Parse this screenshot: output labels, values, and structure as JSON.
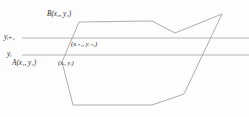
{
  "figure": {
    "background_color": "#fdfdfd",
    "stroke_color": "#8a8a8a",
    "text_color": "#2b2b2b",
    "labels": {
      "vertex_b": "B(x₂, y₂)",
      "vertex_a": "A(x₁, y₁)",
      "scanline_upper": "yᵢ₊₁",
      "scanline_lower": "yᵢ",
      "intersection_upper": "(xᵢ₊₁, yᵢ₊₁)",
      "intersection_lower": "(xᵢ, yᵢ)"
    }
  },
  "chart_data": {
    "type": "line",
    "xlabel": "",
    "ylabel": "",
    "xlim": [
      0,
      249
    ],
    "ylim": [
      117,
      0
    ],
    "grid": false,
    "legend": null,
    "series": [
      {
        "name": "polygon-outline",
        "closed": true,
        "stroke": "#8a8a8a",
        "points": [
          [
            62,
            62
          ],
          [
            79,
            22
          ],
          [
            152,
            21
          ],
          [
            175,
            33
          ],
          [
            222,
            14
          ],
          [
            184,
            94
          ],
          [
            152,
            105
          ],
          [
            73,
            105
          ]
        ]
      },
      {
        "name": "scanline-upper",
        "closed": false,
        "stroke": "#8a8a8a",
        "y": 38,
        "points": [
          [
            22,
            38
          ],
          [
            249,
            38
          ]
        ]
      },
      {
        "name": "scanline-lower",
        "closed": false,
        "stroke": "#8a8a8a",
        "y": 55,
        "points": [
          [
            22,
            55
          ],
          [
            249,
            55
          ]
        ]
      }
    ],
    "annotations": [
      {
        "name": "vertex_b",
        "text": "B(x₂, y₂)",
        "x": 79,
        "y": 22
      },
      {
        "name": "vertex_a",
        "text": "A(x₁, y₁)",
        "x": 62,
        "y": 62
      },
      {
        "name": "scanline_upper",
        "text": "yᵢ₊₁",
        "x": 10,
        "y": 38
      },
      {
        "name": "scanline_lower",
        "text": "yᵢ",
        "x": 12,
        "y": 55
      },
      {
        "name": "intersection_upper",
        "text": "(xᵢ₊₁, yᵢ₊₁)",
        "x": 72,
        "y": 38
      },
      {
        "name": "intersection_lower",
        "text": "(xᵢ, yᵢ)",
        "x": 65,
        "y": 55
      }
    ]
  }
}
